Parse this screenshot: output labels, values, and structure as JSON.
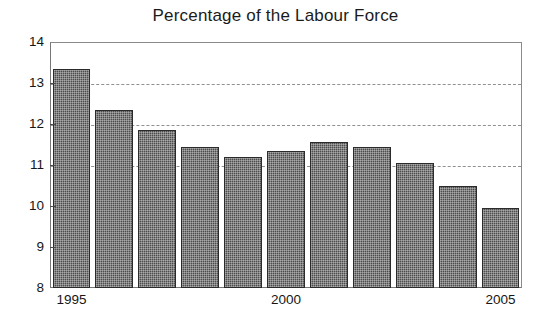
{
  "chart_data": {
    "type": "bar",
    "title": "Percentage of the Labour Force",
    "xlabel": "",
    "ylabel": "",
    "categories": [
      "1995",
      "1996",
      "1997",
      "1998",
      "1999",
      "2000",
      "2001",
      "2002",
      "2003",
      "2004",
      "2005"
    ],
    "values": [
      13.35,
      12.35,
      11.85,
      11.45,
      11.2,
      11.35,
      11.55,
      11.45,
      11.05,
      10.5,
      9.95
    ],
    "ylim": [
      8,
      14
    ],
    "y_ticks": [
      8,
      9,
      10,
      11,
      12,
      13,
      14
    ],
    "y_tick_labels": [
      "8",
      "9",
      "10",
      "11",
      "12",
      "13",
      "14"
    ],
    "x_tick_labels": [
      "1995",
      "2000",
      "2005"
    ],
    "x_tick_categories": [
      "1995",
      "2000",
      "2005"
    ],
    "grid": true,
    "gridlines_at": [
      11,
      12,
      13
    ],
    "grid_style": "dashed",
    "legend": null,
    "legend_position": "none",
    "bar_color": "#4d4d4d",
    "bar_edge_color": "#2b2b2b",
    "axis_color": "#777777",
    "text_color": "#161616",
    "background_color": "#ffffff"
  }
}
